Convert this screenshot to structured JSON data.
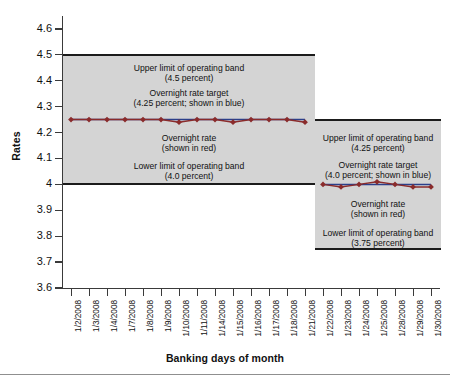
{
  "chart_data": {
    "type": "line",
    "title": "",
    "xlabel": "Banking days of month",
    "ylabel": "Rates",
    "ylim": [
      3.6,
      4.65
    ],
    "yticks": [
      3.6,
      3.7,
      3.8,
      3.9,
      4.0,
      4.1,
      4.2,
      4.3,
      4.4,
      4.5,
      4.6
    ],
    "ytick_labels": [
      "3.6",
      "3.7",
      "3.8",
      "3.9",
      "4",
      "4.1",
      "4.2",
      "4.3",
      "4.4",
      "4.5",
      "4.6"
    ],
    "grid": false,
    "legend": "none",
    "categories": [
      "1/2/2008",
      "1/3/2008",
      "1/4/2008",
      "1/7/2008",
      "1/8/2008",
      "1/9/2008",
      "1/10/2008",
      "1/11/2008",
      "1/14/2008",
      "1/15/2008",
      "1/16/2008",
      "1/17/2008",
      "1/18/2008",
      "1/21/2008",
      "1/22/2008",
      "1/23/2008",
      "1/24/2008",
      "1/25/2008",
      "1/28/2008",
      "1/29/2008",
      "1/30/2008"
    ],
    "series": [
      {
        "name": "Overnight rate",
        "color": "#8a2b2b",
        "marker": "diamond",
        "values": [
          4.25,
          4.25,
          4.25,
          4.25,
          4.25,
          4.25,
          4.24,
          4.25,
          4.25,
          4.24,
          4.25,
          4.25,
          4.25,
          4.24,
          4.0,
          3.99,
          4.0,
          4.01,
          4.0,
          3.99,
          3.99
        ]
      },
      {
        "name": "Overnight rate target",
        "color": "#2b3f8a",
        "values": [
          4.25,
          4.25,
          4.25,
          4.25,
          4.25,
          4.25,
          4.25,
          4.25,
          4.25,
          4.25,
          4.25,
          4.25,
          4.25,
          4.25,
          4.0,
          4.0,
          4.0,
          4.0,
          4.0,
          4.0,
          4.0
        ]
      }
    ],
    "bands": [
      {
        "name": "operating-band-period-1",
        "x_from": "1/2/2008",
        "x_to": "1/21/2008",
        "upper": 4.5,
        "lower": 4.0,
        "target": 4.25,
        "fill": "#d4d4d4",
        "annotations": [
          "Upper limit of operating band",
          "(4.5 percent)",
          "Overnight rate target",
          "(4.25 percent; shown in blue)",
          "Overnight rate",
          "(shown in red)",
          "Lower limit of operating band",
          "(4.0 percent)"
        ]
      },
      {
        "name": "operating-band-period-2",
        "x_from": "1/22/2008",
        "x_to": "1/30/2008",
        "upper": 4.25,
        "lower": 3.75,
        "target": 4.0,
        "fill": "#d4d4d4",
        "annotations": [
          "Upper limit of operating band",
          "(4.25 percent)",
          "Overnight rate target",
          "(4.0 percent; shown in blue)",
          "Overnight rate",
          "(shown in red)",
          "Lower limit of operating band",
          "(3.75 percent)"
        ]
      }
    ]
  },
  "axes": {
    "y_title": "Rates",
    "x_title": "Banking days of month"
  },
  "band_left": {
    "upper_label_line1": "Upper limit of operating band",
    "upper_label_line2": "(4.5 percent)",
    "target_label_line1": "Overnight rate target",
    "target_label_line2": "(4.25 percent; shown in blue)",
    "rate_label_line1": "Overnight rate",
    "rate_label_line2": "(shown in red)",
    "lower_label_line1": "Lower limit of operating band",
    "lower_label_line2": "(4.0 percent)"
  },
  "band_right": {
    "upper_label_line1": "Upper limit of operating band",
    "upper_label_line2": "(4.25 percent)",
    "target_label_line1": "Overnight rate target",
    "target_label_line2": "(4.0 percent; shown in blue)",
    "rate_label_line1": "Overnight rate",
    "rate_label_line2": "(shown in red)",
    "lower_label_line1": "Lower limit of operating band",
    "lower_label_line2": "(3.75 percent)"
  },
  "colors": {
    "band_fill": "#d4d4d4",
    "band_edge": "#1b1b1b",
    "overnight_rate": "#8a2b2b",
    "target_rate": "#2b3f8a",
    "axis": "#3a3a3a"
  }
}
